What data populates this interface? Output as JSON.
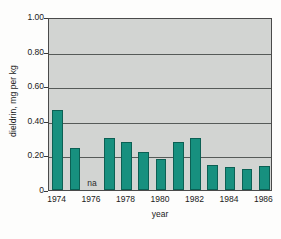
{
  "chart_data": {
    "type": "bar",
    "title": "",
    "subtitle": "",
    "xlabel": "year",
    "ylabel": "dieldrin, mg per kg",
    "ylim": [
      0,
      1.0
    ],
    "grid": true,
    "legend": null,
    "y_ticks": [
      "1.00",
      "0.80",
      "0.60",
      "0.40",
      "0.20",
      "0"
    ],
    "y_tick_values": [
      1.0,
      0.8,
      0.6,
      0.4,
      0.2,
      0
    ],
    "x_tick_labels": [
      "1974",
      "1976",
      "1978",
      "1980",
      "1982",
      "1984",
      "1986"
    ],
    "x_tick_values": [
      1974,
      1976,
      1978,
      1980,
      1982,
      1984,
      1986
    ],
    "categories": [
      1974,
      1975,
      1976,
      1977,
      1978,
      1979,
      1980,
      1981,
      1982,
      1983,
      1984,
      1985,
      1986
    ],
    "values": [
      0.46,
      0.24,
      null,
      0.3,
      0.275,
      0.22,
      0.18,
      0.275,
      0.3,
      0.145,
      0.135,
      0.12,
      0.14
    ],
    "missing_label": "na",
    "missing_categories": [
      1976
    ],
    "bar_color": "#17907f",
    "bar_edge_color": "#0c6054",
    "plot_background": "#d2d4d2",
    "gridline_color": "#565a58",
    "axis_color": "#4a4a4a"
  },
  "figure": {
    "name": "dieldrin-bar-chart"
  }
}
